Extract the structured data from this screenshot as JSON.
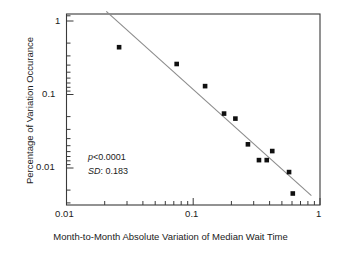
{
  "chart_data": {
    "type": "scatter",
    "title": "",
    "xlabel": "Month-to-Month Absolute Variation of Median Wait Time",
    "ylabel": "Percentage of Variation Occurance",
    "xscale": "log",
    "yscale": "log",
    "xlim": [
      0.01,
      1.0
    ],
    "ylim": [
      0.0025,
      1.4
    ],
    "grid": false,
    "legend": null,
    "x_ticks": [
      "0.01",
      "0.1",
      "1"
    ],
    "x_tick_values": [
      0.01,
      0.1,
      1
    ],
    "y_ticks": [
      "1",
      "0.1",
      "0.01"
    ],
    "y_tick_values": [
      1,
      0.1,
      0.01
    ],
    "series": [
      {
        "name": "Variation occurrence",
        "marker": "square",
        "color": "#101010",
        "x": [
          0.026,
          0.074,
          0.124,
          0.175,
          0.215,
          0.27,
          0.33,
          0.38,
          0.42,
          0.57,
          0.61
        ],
        "y": [
          0.44,
          0.26,
          0.13,
          0.055,
          0.047,
          0.021,
          0.0128,
          0.0128,
          0.017,
          0.0088,
          0.0045
        ]
      }
    ],
    "fit_line": {
      "name": "regression-line",
      "color": "#8c8c8c",
      "x": [
        0.0206,
        0.855
      ],
      "y": [
        1.35,
        0.0042
      ]
    },
    "annotations": [
      {
        "id": "p-value",
        "italic_prefix": "p",
        "rest": "<0.0001"
      },
      {
        "id": "sd-value",
        "italic_prefix": "SD",
        "rest": ": 0.183"
      }
    ]
  },
  "axes": {
    "x_tick_labels": [
      "0.01",
      "0.1",
      "1"
    ],
    "y_tick_labels": [
      "1",
      "0.1",
      "0.01"
    ],
    "xlabel": "Month-to-Month Absolute Variation of Median Wait Time",
    "ylabel": "Percentage of Variation Occurance"
  },
  "annotations": {
    "p_italic": "p",
    "p_rest": "<0.0001",
    "sd_italic": "SD",
    "sd_rest": ": 0.183"
  },
  "colors": {
    "marker": "#101010",
    "fit_line": "#8c8c8c",
    "axis": "#3a3a3a",
    "text": "#1b1b1b",
    "background": "#ffffff"
  }
}
